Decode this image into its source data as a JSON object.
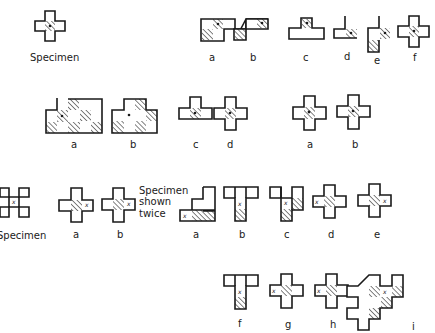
{
  "figure": {
    "colors": {
      "ink": "#1a1a1a",
      "background": "#ffffff"
    },
    "row1": {
      "specimen_label": "Specimen",
      "left_group_labels": [
        "a",
        "b",
        "c",
        "d",
        "e",
        "f"
      ]
    },
    "row2": {
      "group1_labels": [
        "a",
        "b"
      ],
      "group2_labels": [
        "c",
        "d"
      ],
      "group3_labels": [
        "a",
        "b"
      ]
    },
    "row3": {
      "specimen_label": "Specimen",
      "group1_labels": [
        "a",
        "b"
      ],
      "note_line1": "Specimen",
      "note_line2": "shown",
      "note_line3": "twice",
      "group2_labels": [
        "a",
        "b",
        "c",
        "d",
        "e"
      ]
    },
    "row4": {
      "labels": [
        "f",
        "g",
        "h",
        "i"
      ]
    },
    "marker_glyph": "x"
  }
}
